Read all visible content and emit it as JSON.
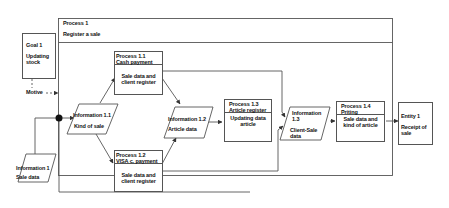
{
  "outer_process": {
    "title": "Process 1",
    "subtitle": "Register a sale"
  },
  "goal": {
    "title": "Goal 1",
    "body_line1": "Updating",
    "body_line2": "stock"
  },
  "motive_label": "Motive",
  "information_1": {
    "title": "Information 1",
    "body": "Sale data"
  },
  "information_1_1": {
    "title": "Information 1.1",
    "body": "Kind of sale"
  },
  "process_1_1": {
    "title": "Process 1.1",
    "subtitle": "Cash payment",
    "body_line1": "Sale data and",
    "body_line2": "client register"
  },
  "process_1_2": {
    "title": "Process 1.2",
    "subtitle": "VISA c. payment",
    "body_line1": "Sale data and",
    "body_line2": "client register"
  },
  "information_1_2": {
    "title": "Information 1.2",
    "body": "Article data"
  },
  "process_1_3": {
    "title": "Process 1.3",
    "subtitle": "Article register",
    "body_line1": "Updating data",
    "body_line2": "article"
  },
  "information_1_3": {
    "title_line1": "Information",
    "title_line2": "1.3",
    "body_line1": "Client-Sale",
    "body_line2": "data"
  },
  "process_1_4": {
    "title": "Process 1.4",
    "subtitle": "Priting",
    "body_line1": "Sale data and",
    "body_line2": "kind of article"
  },
  "entity_1": {
    "title": "Entity 1",
    "body_line1": "Receipt of",
    "body_line2": "sale"
  },
  "colors": {
    "line": "#555555",
    "text": "#111111",
    "background": "#ffffff"
  }
}
